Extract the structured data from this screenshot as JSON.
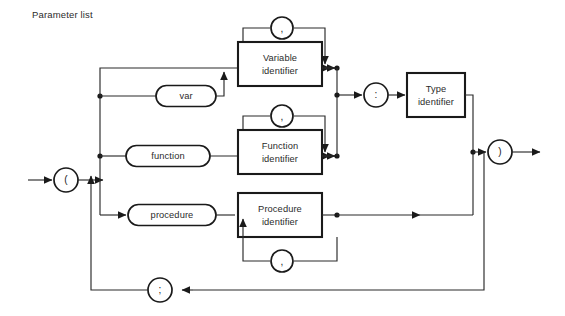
{
  "caption": "Parameter list",
  "diagram": {
    "kind": "railroad-syntax-diagram",
    "title": "Parameter list",
    "colors": {
      "stroke": "#1a1a1a",
      "wire": "#2a2a2a",
      "background": "#ffffff",
      "text": "#2b2b2b"
    },
    "nodes": {
      "open_paren": "(",
      "close_paren": ")",
      "colon": ":",
      "semicolon": ";",
      "comma_variable": ",",
      "comma_function": ",",
      "comma_procedure": ","
    },
    "terminals": {
      "var": "var",
      "function": "function",
      "procedure": "procedure"
    },
    "nonterminals": {
      "variable_identifier_line1": "Variable",
      "variable_identifier_line2": "identifier",
      "function_identifier_line1": "Function",
      "function_identifier_line2": "identifier",
      "procedure_identifier_line1": "Procedure",
      "procedure_identifier_line2": "identifier",
      "type_identifier_line1": "Type",
      "type_identifier_line2": "identifier"
    }
  }
}
